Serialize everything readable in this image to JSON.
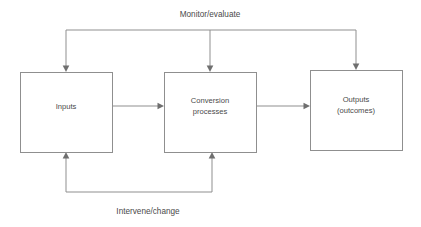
{
  "diagram": {
    "type": "systems-flow-diagram",
    "background_color": "#ffffff",
    "line_color": "#8f8f8f",
    "text_color": "#4a4a4a",
    "nodes": [
      {
        "id": "inputs",
        "label_line1": "Inputs",
        "label_line2": "",
        "x": 20,
        "y": 72,
        "width": 92,
        "height": 80
      },
      {
        "id": "conversion",
        "label_line1": "Conversion",
        "label_line2": "processes",
        "x": 164,
        "y": 72,
        "width": 92,
        "height": 80
      },
      {
        "id": "outputs",
        "label_line1": "Outputs",
        "label_line2": "(outcomes)",
        "x": 310,
        "y": 70,
        "width": 92,
        "height": 80
      }
    ],
    "edge_labels": {
      "top_feedback": "Monitor/evaluate",
      "bottom_feedback": "Intervene/change"
    },
    "connections": [
      {
        "from": "inputs",
        "to": "conversion",
        "direction": "right"
      },
      {
        "from": "conversion",
        "to": "outputs",
        "direction": "right"
      },
      {
        "from": "monitor-bus",
        "to": "inputs",
        "direction": "down"
      },
      {
        "from": "monitor-bus",
        "to": "conversion",
        "direction": "down"
      },
      {
        "from": "outputs",
        "to": "monitor-bus",
        "direction": "up"
      },
      {
        "from": "intervene-bus",
        "to": "inputs",
        "direction": "up"
      },
      {
        "from": "intervene-bus",
        "to": "conversion",
        "direction": "up"
      }
    ]
  }
}
